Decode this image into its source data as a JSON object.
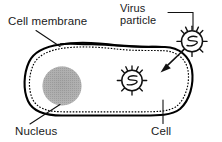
{
  "figure": {
    "type": "biological-schematic",
    "background_color": "#ffffff",
    "ink_color": "#000000"
  },
  "labels": {
    "cell_membrane": "Cell membrane",
    "virus_particle_line1": "Virus",
    "virus_particle_line2": "particle",
    "nucleus": "Nucleus",
    "cell": "Cell"
  },
  "parts": {
    "cell": {
      "name": "cell",
      "shape": "elongated rounded blob",
      "outline_style": "solid",
      "fill_color": "#ffffff"
    },
    "cell_membrane": {
      "name": "cell-membrane",
      "outline_style": "dashed",
      "position": "just inside the cell outline"
    },
    "nucleus": {
      "name": "nucleus",
      "shape": "circle",
      "fill_color": "#a8a8a8",
      "texture": "stippled"
    },
    "virus_inside": {
      "name": "virus-particle-inside-cell",
      "shape": "spiked circle with coiled genome",
      "spike_count": 10
    },
    "virus_outside": {
      "name": "virus-particle-outside-cell",
      "shape": "spiked circle with coiled genome",
      "spike_count": 10
    },
    "entry_arrow": {
      "name": "virus-entry-arrow",
      "direction": "from outside virus into the cell",
      "style": "curved arrow with solid head"
    }
  }
}
